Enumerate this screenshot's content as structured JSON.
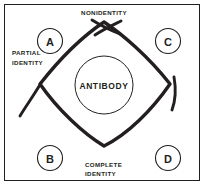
{
  "figure": {
    "background_color": "#ffffff",
    "ink_color": "#231f20",
    "border_color": "#231f20"
  },
  "center": {
    "label": "ANTIBODY"
  },
  "wells": [
    {
      "id": "a",
      "label": "A",
      "position": "upper-left"
    },
    {
      "id": "c",
      "label": "C",
      "position": "upper-right"
    },
    {
      "id": "b",
      "label": "B",
      "position": "lower-left"
    },
    {
      "id": "d",
      "label": "D",
      "position": "lower-right"
    }
  ],
  "zones": [
    {
      "id": "nonidentity",
      "lines": [
        "NONIDENTITY"
      ],
      "position": "top"
    },
    {
      "id": "partial-identity",
      "lines": [
        "PARTIAL",
        "IDENTITY"
      ],
      "position": "left"
    },
    {
      "id": "complete-identity",
      "lines": [
        "COMPLETE",
        "IDENTITY"
      ],
      "position": "bottom"
    }
  ],
  "zone_text": {
    "nonidentity": "NONIDENTITY",
    "partial_line1": "PARTIAL",
    "partial_line2": "IDENTITY",
    "complete_line1": "COMPLETE",
    "complete_line2": "IDENTITY"
  }
}
